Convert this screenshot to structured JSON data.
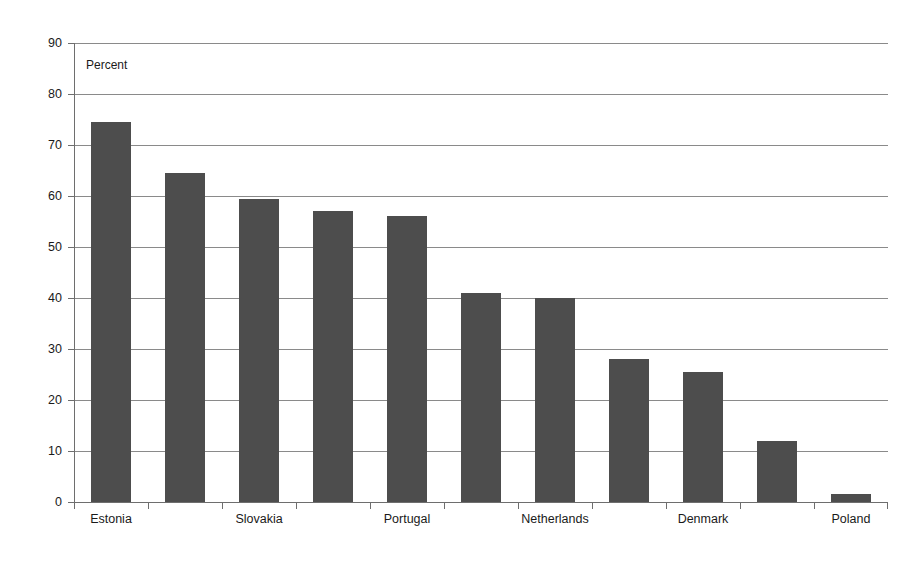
{
  "chart_data": {
    "type": "bar",
    "title": "",
    "subtitle": "",
    "annotation": "Percent",
    "xlabel": "",
    "ylabel": "",
    "ylim": [
      0,
      90
    ],
    "ytick_step": 10,
    "yticks": [
      90,
      80,
      70,
      60,
      50,
      40,
      30,
      20,
      10,
      0
    ],
    "ytick_labels": [
      "90",
      "80",
      "70",
      "60",
      "50",
      "40",
      "30",
      "20",
      "10",
      "0"
    ],
    "grid": true,
    "grid_axis": "y",
    "legend": false,
    "legend_position": "none",
    "bar_color": "#4d4d4d",
    "grid_color": "#8a8a8a",
    "axis_color": "#6e6e6e",
    "text_color": "#1a1a1a",
    "categories": [
      "Estonia",
      "",
      "Slovakia",
      "",
      "Portugal",
      "",
      "Netherlands",
      "",
      "Denmark",
      "",
      "Poland"
    ],
    "visible_xtick_labels": [
      "Estonia",
      "Slovakia",
      "Portugal",
      "Netherlands",
      "Denmark",
      "Poland"
    ],
    "values": [
      74.5,
      64.5,
      59.5,
      57.0,
      56.0,
      41.0,
      40.0,
      28.0,
      25.5,
      12.0,
      1.5
    ],
    "bar_count": 11
  }
}
